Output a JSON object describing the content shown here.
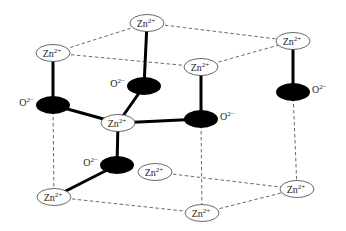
{
  "diagram": {
    "colors": {
      "zn_fill": "#ffffff",
      "zn_stroke": "#444444",
      "o_fill": "#000000",
      "bond": "#000000",
      "cell_edge": "#444444"
    },
    "zn_label": {
      "base": "Zn",
      "sup": "2+"
    },
    "o_label": {
      "base": "O",
      "sup": "2−"
    },
    "zn_nodes": [
      {
        "id": "zn-top-back",
        "x": 147,
        "y": 23
      },
      {
        "id": "zn-top-left",
        "x": 53,
        "y": 53
      },
      {
        "id": "zn-top-right",
        "x": 293,
        "y": 41
      },
      {
        "id": "zn-top-front",
        "x": 201,
        "y": 67
      },
      {
        "id": "zn-center",
        "x": 118,
        "y": 123
      },
      {
        "id": "zn-bottom-back",
        "x": 155,
        "y": 172
      },
      {
        "id": "zn-bottom-left",
        "x": 54,
        "y": 197
      },
      {
        "id": "zn-bottom-right",
        "x": 297,
        "y": 189
      },
      {
        "id": "zn-bottom-front",
        "x": 202,
        "y": 213
      }
    ],
    "o_nodes": [
      {
        "id": "o-upper-center",
        "x": 144,
        "y": 86,
        "label_side": "left"
      },
      {
        "id": "o-left",
        "x": 53,
        "y": 105,
        "label_side": "left"
      },
      {
        "id": "o-right",
        "x": 201,
        "y": 119,
        "label_side": "right"
      },
      {
        "id": "o-far-right",
        "x": 293,
        "y": 92,
        "label_side": "right"
      },
      {
        "id": "o-lower-center",
        "x": 117,
        "y": 165,
        "label_side": "left"
      }
    ],
    "bonds": [
      [
        "zn-top-back",
        "o-upper-center"
      ],
      [
        "zn-top-left",
        "o-left"
      ],
      [
        "zn-top-front",
        "o-right"
      ],
      [
        "zn-top-right",
        "o-far-right"
      ],
      [
        "o-upper-center",
        "zn-center"
      ],
      [
        "o-left",
        "zn-center"
      ],
      [
        "o-right",
        "zn-center"
      ],
      [
        "zn-center",
        "o-lower-center"
      ],
      [
        "o-lower-center",
        "zn-bottom-left"
      ]
    ],
    "cell_edges": [
      [
        "zn-top-left",
        "zn-top-back"
      ],
      [
        "zn-top-back",
        "zn-top-right"
      ],
      [
        "zn-top-left",
        "zn-top-front"
      ],
      [
        "zn-top-front",
        "zn-top-right"
      ],
      [
        "zn-bottom-left",
        "zn-bottom-front"
      ],
      [
        "zn-bottom-front",
        "zn-bottom-right"
      ],
      [
        "zn-bottom-back",
        "zn-bottom-right"
      ],
      [
        "o-left",
        "zn-bottom-left"
      ],
      [
        "o-right",
        "zn-bottom-front"
      ],
      [
        "o-far-right",
        "zn-bottom-right"
      ]
    ]
  }
}
